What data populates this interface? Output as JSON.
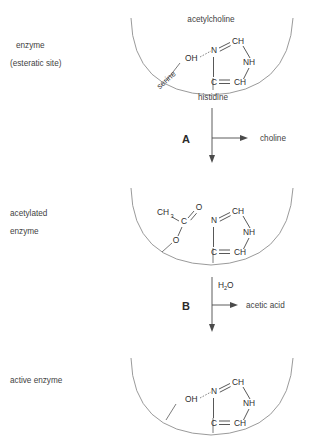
{
  "figure": {
    "background_color": "#ffffff",
    "ink_color": "#3a3a3a",
    "arc_color": "#8f8f8f"
  },
  "panels": [
    {
      "id": "panel-enzyme",
      "side_label_lines": [
        "enzyme",
        "(esteratic site)"
      ],
      "top_label": "acetylcholine",
      "site_labels": [
        "serine",
        "histidine"
      ],
      "atoms": [
        "OH",
        "N",
        "CH",
        "NH",
        "C",
        "CH"
      ],
      "bond_notes": [
        "hydrogen bond OH---N",
        "imidazole ring"
      ]
    },
    {
      "id": "panel-acetylated",
      "side_label_lines": [
        "acetylated",
        "enzyme"
      ],
      "top_label": "",
      "site_labels": [],
      "atoms": [
        "CH",
        "3",
        "C",
        "O",
        "O",
        "N",
        "CH",
        "NH",
        "C",
        "CH"
      ],
      "bond_notes": [
        "acetyl ester CH3-C(=O)-O",
        "imidazole ring"
      ]
    },
    {
      "id": "panel-active",
      "side_label_lines": [
        "active enzyme"
      ],
      "top_label": "",
      "site_labels": [],
      "atoms": [
        "OH",
        "N",
        "CH",
        "NH",
        "C",
        "CH"
      ],
      "bond_notes": [
        "hydrogen bond OH---N",
        "imidazole ring"
      ]
    }
  ],
  "steps": [
    {
      "id": "step-a",
      "letter": "A",
      "product": "choline",
      "reactant": ""
    },
    {
      "id": "step-b",
      "letter": "B",
      "product": "acetic acid",
      "reactant": "H",
      "reactant_sub": "2",
      "reactant_tail": "O"
    }
  ],
  "atom_labels": {
    "oh": "OH",
    "n": "N",
    "nh": "NH",
    "c": "C",
    "ch": "CH",
    "ch3_main": "CH",
    "ch3_sub": "3",
    "o_carbonyl": "O",
    "o_ester": "O"
  }
}
